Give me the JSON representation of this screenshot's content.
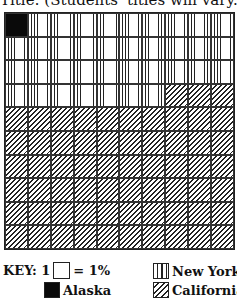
{
  "title": "Title: (Students' titles will vary.)",
  "key": {
    "prefix": "KEY: 1",
    "suffix": "= 1%",
    "items": [
      {
        "label": "New York",
        "pattern": "vertical-lines"
      },
      {
        "label": "Alaska",
        "pattern": "solid-black"
      },
      {
        "label": "California",
        "pattern": "diagonal-lines"
      }
    ]
  },
  "chart_data": {
    "type": "table",
    "subtype": "10x10 percent grid (waffle chart)",
    "title": "Title: (Students' titles will vary.)",
    "unit": "1 square = 1%",
    "grid": {
      "rows": 10,
      "cols": 10
    },
    "categories": [
      "Alaska",
      "New York",
      "California"
    ],
    "values": [
      1,
      36,
      63
    ],
    "fill_order": "row-major from top-left",
    "cell_layout": [
      [
        "AK",
        "NY",
        "NY",
        "NY",
        "NY",
        "NY",
        "NY",
        "NY",
        "NY",
        "NY"
      ],
      [
        "NY",
        "NY",
        "NY",
        "NY",
        "NY",
        "NY",
        "NY",
        "NY",
        "NY",
        "NY"
      ],
      [
        "NY",
        "NY",
        "NY",
        "NY",
        "NY",
        "NY",
        "NY",
        "NY",
        "NY",
        "NY"
      ],
      [
        "NY",
        "NY",
        "NY",
        "NY",
        "NY",
        "NY",
        "NY",
        "CA",
        "CA",
        "CA"
      ],
      [
        "CA",
        "CA",
        "CA",
        "CA",
        "CA",
        "CA",
        "CA",
        "CA",
        "CA",
        "CA"
      ],
      [
        "CA",
        "CA",
        "CA",
        "CA",
        "CA",
        "CA",
        "CA",
        "CA",
        "CA",
        "CA"
      ],
      [
        "CA",
        "CA",
        "CA",
        "CA",
        "CA",
        "CA",
        "CA",
        "CA",
        "CA",
        "CA"
      ],
      [
        "CA",
        "CA",
        "CA",
        "CA",
        "CA",
        "CA",
        "CA",
        "CA",
        "CA",
        "CA"
      ],
      [
        "CA",
        "CA",
        "CA",
        "CA",
        "CA",
        "CA",
        "CA",
        "CA",
        "CA",
        "CA"
      ],
      [
        "CA",
        "CA",
        "CA",
        "CA",
        "CA",
        "CA",
        "CA",
        "CA",
        "CA",
        "CA"
      ]
    ],
    "legend": [
      {
        "name": "Alaska",
        "pattern": "solid black"
      },
      {
        "name": "New York",
        "pattern": "vertical lines"
      },
      {
        "name": "California",
        "pattern": "diagonal hatching"
      }
    ],
    "legend_position": "bottom"
  }
}
